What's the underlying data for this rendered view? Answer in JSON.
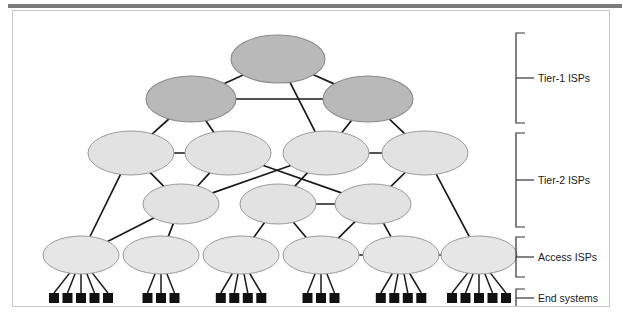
{
  "figure": {
    "frame_border_color": "#c8c8c8",
    "background": "#ffffff",
    "top_rule_color": "#7b7b7b",
    "caption_fragment": ""
  },
  "legend": {
    "bracket_color": "#333333",
    "items": [
      {
        "id": "tier1",
        "label": "Tier-1 ISPs"
      },
      {
        "id": "tier2",
        "label": "Tier-2 ISPs"
      },
      {
        "id": "access",
        "label": "Access ISPs"
      },
      {
        "id": "end",
        "label": "End systems"
      }
    ]
  },
  "palette": {
    "tier1_fill": "#b9b9b9",
    "tier1_stroke": "#8a8a8a",
    "tier2_fill": "#e2e2e2",
    "tier2_stroke": "#9a9a9a",
    "access_fill": "#e6e6e6",
    "access_stroke": "#9a9a9a",
    "end_fill": "#111111",
    "link_color": "#1a1a1a"
  },
  "chart_data": {
    "type": "diagram",
    "nodes": {
      "tier1": [
        {
          "id": "t1a",
          "cx": 265,
          "cy": 48,
          "rx": 47,
          "ry": 24
        },
        {
          "id": "t1b",
          "cx": 178,
          "cy": 88,
          "rx": 45,
          "ry": 23
        },
        {
          "id": "t1c",
          "cx": 355,
          "cy": 88,
          "rx": 45,
          "ry": 23
        }
      ],
      "tier2_upper": [
        {
          "id": "t2a",
          "cx": 118,
          "cy": 142,
          "rx": 43,
          "ry": 22
        },
        {
          "id": "t2b",
          "cx": 215,
          "cy": 142,
          "rx": 43,
          "ry": 22
        },
        {
          "id": "t2c",
          "cx": 313,
          "cy": 142,
          "rx": 43,
          "ry": 22
        },
        {
          "id": "t2d",
          "cx": 412,
          "cy": 142,
          "rx": 43,
          "ry": 22
        }
      ],
      "tier2_lower": [
        {
          "id": "t2e",
          "cx": 168,
          "cy": 193,
          "rx": 38,
          "ry": 20
        },
        {
          "id": "t2f",
          "cx": 265,
          "cy": 193,
          "rx": 38,
          "ry": 20
        },
        {
          "id": "t2g",
          "cx": 360,
          "cy": 193,
          "rx": 38,
          "ry": 20
        }
      ],
      "access": [
        {
          "id": "a1",
          "cx": 68,
          "cy": 244,
          "rx": 38,
          "ry": 19,
          "hosts": 5
        },
        {
          "id": "a2",
          "cx": 148,
          "cy": 244,
          "rx": 38,
          "ry": 19,
          "hosts": 3
        },
        {
          "id": "a3",
          "cx": 228,
          "cy": 244,
          "rx": 38,
          "ry": 19,
          "hosts": 4
        },
        {
          "id": "a4",
          "cx": 308,
          "cy": 244,
          "rx": 38,
          "ry": 19,
          "hosts": 3
        },
        {
          "id": "a5",
          "cx": 388,
          "cy": 244,
          "rx": 38,
          "ry": 19,
          "hosts": 4
        },
        {
          "id": "a6",
          "cx": 466,
          "cy": 244,
          "rx": 38,
          "ry": 19,
          "hosts": 5
        }
      ]
    },
    "end_system_counts": [
      5,
      3,
      4,
      3,
      4,
      5
    ],
    "end_system_total": 24,
    "links": [
      [
        "t1a",
        "t1b"
      ],
      [
        "t1a",
        "t1c"
      ],
      [
        "t1b",
        "t1c"
      ],
      [
        "t1b",
        "t2a"
      ],
      [
        "t1b",
        "t2b"
      ],
      [
        "t1a",
        "t2c"
      ],
      [
        "t1c",
        "t2c"
      ],
      [
        "t1c",
        "t2d"
      ],
      [
        "t2a",
        "t2b"
      ],
      [
        "t2c",
        "t2d"
      ],
      [
        "t2b",
        "t2e"
      ],
      [
        "t2a",
        "t2e"
      ],
      [
        "t2c",
        "t2f"
      ],
      [
        "t2b",
        "t2g"
      ],
      [
        "t2c",
        "t2e"
      ],
      [
        "t2d",
        "t2g"
      ],
      [
        "t2f",
        "t2g"
      ],
      [
        "t2a",
        "a1"
      ],
      [
        "t2e",
        "a1"
      ],
      [
        "t2e",
        "a2"
      ],
      [
        "t2f",
        "a3"
      ],
      [
        "t2f",
        "a4"
      ],
      [
        "t2g",
        "a4"
      ],
      [
        "t2g",
        "a5"
      ],
      [
        "t2d",
        "a6"
      ],
      [
        "a4",
        "a5"
      ],
      [
        "a5",
        "a6"
      ]
    ],
    "legend_brackets": [
      {
        "id": "tier1",
        "y_top": 22,
        "y_bottom": 112,
        "label": "Tier-1 ISPs"
      },
      {
        "id": "tier2",
        "y_top": 122,
        "y_bottom": 216,
        "label": "Tier-2 ISPs"
      },
      {
        "id": "access",
        "y_top": 226,
        "y_bottom": 266,
        "label": "Access ISPs"
      },
      {
        "id": "end",
        "y_top": 278,
        "y_bottom": 296,
        "label": "End systems"
      }
    ]
  }
}
